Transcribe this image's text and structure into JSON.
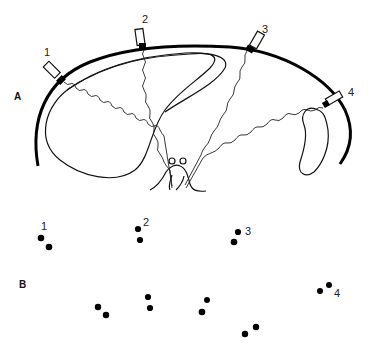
{
  "figure": {
    "panels": [
      {
        "id": "A",
        "label": "A",
        "probes": [
          {
            "label": "1"
          },
          {
            "label": "2"
          },
          {
            "label": "3"
          },
          {
            "label": "4"
          }
        ]
      },
      {
        "id": "B",
        "label": "B",
        "dot_groups": [
          {
            "label": "1"
          },
          {
            "label": "2"
          },
          {
            "label": "3"
          },
          {
            "label": "4"
          }
        ]
      }
    ],
    "colors": {
      "ink": "#000000",
      "background": "#ffffff"
    }
  }
}
